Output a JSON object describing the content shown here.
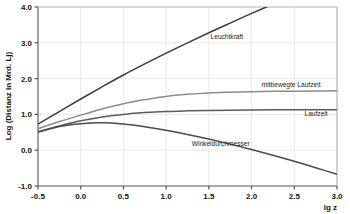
{
  "chart_data": {
    "type": "line",
    "title": "",
    "xlabel": "lg z",
    "ylabel": "Log (Distanz in Mrd. Lj)",
    "xlim": [
      -0.5,
      3.0
    ],
    "ylim": [
      -1.0,
      4.0
    ],
    "xticks": [
      "-0.5",
      "0.0",
      "0.5",
      "1.0",
      "1.5",
      "2.0",
      "2.5",
      "3.0"
    ],
    "xtick_values": [
      -0.5,
      0.0,
      0.5,
      1.0,
      1.5,
      2.0,
      2.5,
      3.0
    ],
    "yticks": [
      "-1.0",
      "0.0",
      "1.0",
      "2.0",
      "3.0",
      "4.0"
    ],
    "ytick_values": [
      -1.0,
      0.0,
      1.0,
      2.0,
      3.0,
      4.0
    ],
    "grid": true,
    "legend": "inline-labels",
    "x": [
      -0.5,
      -0.25,
      0.0,
      0.25,
      0.5,
      0.75,
      1.0,
      1.25,
      1.5,
      1.75,
      2.0,
      2.25,
      2.5,
      2.75,
      3.0
    ],
    "series": [
      {
        "name": "Leuchtkraft",
        "color": "#3d3d3d",
        "label_x": 1.52,
        "label_y": 3.16,
        "values": [
          0.73,
          1.08,
          1.43,
          1.77,
          2.1,
          2.41,
          2.71,
          3.0,
          3.28,
          3.55,
          3.82,
          4.08,
          4.34,
          4.6,
          4.86
        ]
      },
      {
        "name": "mitbewegte Laufzeit",
        "color": "#8c8c8c",
        "label_x": 2.12,
        "label_y": 1.82,
        "values": [
          0.6,
          0.8,
          0.98,
          1.15,
          1.3,
          1.41,
          1.5,
          1.56,
          1.6,
          1.62,
          1.635,
          1.645,
          1.65,
          1.655,
          1.66
        ]
      },
      {
        "name": "Laufzeit",
        "color": "#5a5a5a",
        "label_x": 2.62,
        "label_y": 1.01,
        "values": [
          0.52,
          0.68,
          0.82,
          0.93,
          1.0,
          1.05,
          1.083,
          1.1,
          1.112,
          1.119,
          1.124,
          1.127,
          1.129,
          1.131,
          1.132
        ]
      },
      {
        "name": "Winkeldurchmesser",
        "color": "#4a4a4a",
        "label_x": 1.3,
        "label_y": 0.18,
        "values": [
          0.5,
          0.66,
          0.74,
          0.765,
          0.73,
          0.655,
          0.555,
          0.44,
          0.31,
          0.17,
          0.02,
          -0.14,
          -0.31,
          -0.49,
          -0.67
        ]
      }
    ]
  }
}
